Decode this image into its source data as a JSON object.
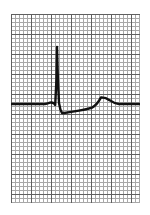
{
  "figure": {
    "kind": "ecg-rhythm-strip",
    "background_color": "#ffffff",
    "grid_minor_color": "#a8a8a8",
    "grid_major_color": "#606060",
    "trace_color": "#111111",
    "paper": {
      "left": 11,
      "top": 14,
      "width": 129,
      "height": 189,
      "minor_cell_px": 4,
      "major_cell_px": 20,
      "minor_cells_x": 32,
      "minor_cells_y": 47
    }
  },
  "chart_data": {
    "type": "line",
    "title": "",
    "subtitle": "",
    "xlabel": "",
    "ylabel": "",
    "grid": true,
    "legend_position": "none",
    "annotations": [],
    "axis": {
      "x_px_range": [
        0,
        129
      ],
      "y_px_range": [
        0,
        189
      ],
      "baseline_y_px": 90,
      "x_tick_labels": [],
      "y_tick_labels": []
    },
    "features": [
      {
        "name": "baseline-left",
        "x_px": 0,
        "y_px": 90
      },
      {
        "name": "p-wave",
        "x_px": 40,
        "y_px": 88
      },
      {
        "name": "q-wave",
        "x_px": 44,
        "y_px": 91
      },
      {
        "name": "r-wave-peak",
        "x_px": 46,
        "y_px": 33
      },
      {
        "name": "s-wave-trough",
        "x_px": 52,
        "y_px": 99
      },
      {
        "name": "st-segment",
        "x_px": 72,
        "y_px": 95
      },
      {
        "name": "t-wave-peak",
        "x_px": 90,
        "y_px": 83
      },
      {
        "name": "baseline-right",
        "x_px": 129,
        "y_px": 90
      }
    ],
    "x": [
      0,
      6,
      12,
      18,
      24,
      30,
      34,
      37,
      39,
      41,
      43,
      44,
      45,
      45.6,
      46,
      46.4,
      47,
      48,
      49,
      50,
      51,
      52,
      54,
      57,
      61,
      66,
      71,
      76,
      80,
      84,
      87,
      90,
      93,
      96,
      99,
      103,
      108,
      114,
      121,
      129
    ],
    "y": [
      90,
      90,
      90,
      90,
      90,
      90,
      90,
      89.6,
      89,
      88.4,
      89,
      90.4,
      78,
      55,
      33,
      55,
      76,
      89,
      95,
      98,
      99,
      99,
      98.4,
      97.6,
      97,
      96.4,
      96,
      95.4,
      94.4,
      92.4,
      88.4,
      84.4,
      83,
      83.6,
      85.6,
      88.6,
      90,
      90,
      90,
      90
    ],
    "series": [
      {
        "name": "ECG lead trace",
        "path": "M0,90 L24,90 L34,90 Q37,89.4 39,88.6 Q41,88.2 43,89.4 L44.2,91 L45.4,66 L46,33 L46.8,62 L48,89 L49.4,95.6 L51,99 L53,99 Q60,98 68,96.6 Q76,95.4 81,93.6 Q86,91 90,83.4 Q94.5,83.2 99,86.4 Q103,89.4 108,90 L129,90"
      }
    ]
  }
}
